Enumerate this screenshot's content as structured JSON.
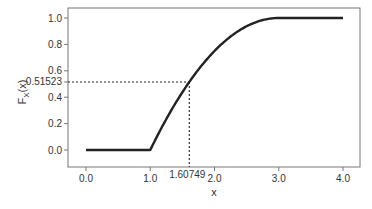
{
  "chart_data": {
    "type": "line",
    "title": "",
    "xlabel": "x",
    "ylabel": "F_X(x)",
    "ylabel_main": "F",
    "ylabel_sub": "X",
    "ylabel_tail": "(x)",
    "xlim": [
      0.0,
      4.0
    ],
    "ylim": [
      0.0,
      1.0
    ],
    "grid": false,
    "legend": null,
    "x_ticks": [
      {
        "value": 0.0,
        "label": "0.0"
      },
      {
        "value": 1.0,
        "label": "1.0"
      },
      {
        "value": 1.60749,
        "label": "1.60749"
      },
      {
        "value": 2.0,
        "label": "2.0"
      },
      {
        "value": 3.0,
        "label": "3.0"
      },
      {
        "value": 4.0,
        "label": "4.0"
      }
    ],
    "y_ticks": [
      {
        "value": 0.0,
        "label": "0.0"
      },
      {
        "value": 0.2,
        "label": "0.2"
      },
      {
        "value": 0.4,
        "label": "0.4"
      },
      {
        "value": 0.51523,
        "label": "0.51523"
      },
      {
        "value": 0.6,
        "label": "0.6"
      },
      {
        "value": 0.8,
        "label": "0.8"
      },
      {
        "value": 1.0,
        "label": "1.0"
      }
    ],
    "series": [
      {
        "name": "F_X(x)",
        "x": [
          0.0,
          0.5,
          1.0,
          1.25,
          1.5,
          1.60749,
          1.75,
          2.0,
          2.25,
          2.5,
          2.75,
          3.0,
          3.5,
          4.0
        ],
        "values": [
          0.0,
          0.0,
          0.0,
          0.234,
          0.4375,
          0.51523,
          0.609,
          0.75,
          0.859,
          0.9375,
          0.984,
          1.0,
          1.0,
          1.0
        ]
      }
    ],
    "annotations": [
      {
        "type": "dotted-reference",
        "x": 1.60749,
        "y": 0.51523,
        "text_x": "1.60749",
        "text_y": "0.51523"
      }
    ]
  }
}
